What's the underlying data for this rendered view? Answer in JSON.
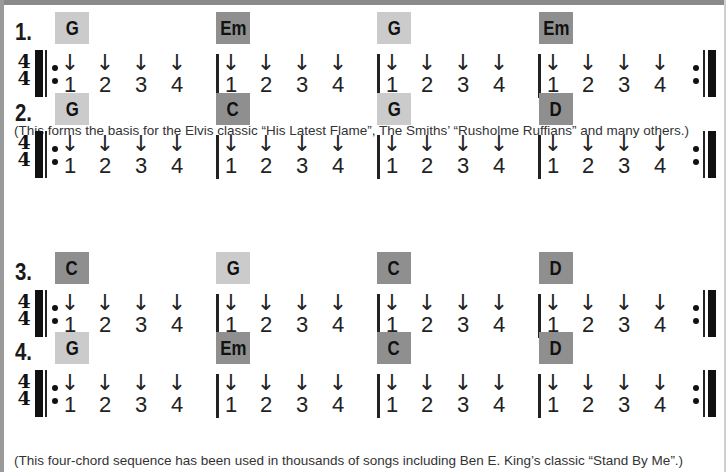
{
  "progressions": [
    {
      "number": "1.",
      "chords": [
        {
          "label": "G",
          "shade": "light"
        },
        {
          "label": "Em",
          "shade": "dark"
        },
        {
          "label": "G",
          "shade": "light"
        },
        {
          "label": "Em",
          "shade": "dark"
        }
      ],
      "time_signature": {
        "top": "4",
        "bottom": "4"
      },
      "beats": [
        "1",
        "2",
        "3",
        "4"
      ],
      "strum": "↓",
      "caption": "(This forms the basis for the Elvis classic “His Latest Flame”, The Smiths’ “Rusholme Ruffians” and many others.)"
    },
    {
      "number": "2.",
      "chords": [
        {
          "label": "G",
          "shade": "light"
        },
        {
          "label": "C",
          "shade": "dark"
        },
        {
          "label": "G",
          "shade": "light"
        },
        {
          "label": "D",
          "shade": "dark"
        }
      ],
      "time_signature": {
        "top": "4",
        "bottom": "4"
      },
      "beats": [
        "1",
        "2",
        "3",
        "4"
      ],
      "strum": "↓",
      "caption": ""
    },
    {
      "number": "3.",
      "chords": [
        {
          "label": "C",
          "shade": "dark"
        },
        {
          "label": "G",
          "shade": "light"
        },
        {
          "label": "C",
          "shade": "dark"
        },
        {
          "label": "D",
          "shade": "dark"
        }
      ],
      "time_signature": {
        "top": "4",
        "bottom": "4"
      },
      "beats": [
        "1",
        "2",
        "3",
        "4"
      ],
      "strum": "↓",
      "caption": ""
    },
    {
      "number": "4.",
      "chords": [
        {
          "label": "G",
          "shade": "light"
        },
        {
          "label": "Em",
          "shade": "dark"
        },
        {
          "label": "C",
          "shade": "dark"
        },
        {
          "label": "D",
          "shade": "dark"
        }
      ],
      "time_signature": {
        "top": "4",
        "bottom": "4"
      },
      "beats": [
        "1",
        "2",
        "3",
        "4"
      ],
      "strum": "↓",
      "caption": "(This four-chord sequence has been used in thousands of songs including Ben E. King’s classic “Stand By Me”.)"
    }
  ],
  "colors": {
    "chord_light": "#cbcbcb",
    "chord_dark": "#8f8f8f",
    "border": "#8a8a8a"
  }
}
